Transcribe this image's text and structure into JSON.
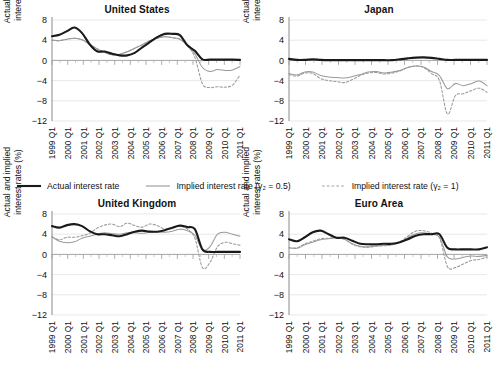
{
  "figure": {
    "ylabel": "Actual and implied\ninterest rates (%)",
    "y_ticks": [
      "8",
      "4",
      "0",
      "−4",
      "−8",
      "−12"
    ],
    "x_ticks": [
      "1999 Q1",
      "2000 Q1",
      "2001 Q1",
      "2002 Q1",
      "2003 Q1",
      "2004 Q1",
      "2005 Q1",
      "2006 Q1",
      "2007 Q1",
      "2008 Q1",
      "2009 Q1",
      "2010 Q1",
      "2011 Q1"
    ]
  },
  "legend": {
    "items": [
      {
        "label": "Actual interest rate",
        "style": "solid-black",
        "color": "#1a1a1a"
      },
      {
        "label": "Implied interest rate (γ₂ = 0.5)",
        "style": "solid-gray",
        "color": "#9a9a9a"
      },
      {
        "label": "Implied interest rate (γ₂ = 1)",
        "style": "dashed-gray",
        "color": "#9a9a9a"
      }
    ]
  },
  "panels": [
    {
      "id": "us",
      "title": "United States"
    },
    {
      "id": "jp",
      "title": "Japan"
    },
    {
      "id": "uk",
      "title": "United Kingdom"
    },
    {
      "id": "ea",
      "title": "Euro Area"
    }
  ],
  "chart_data": [
    {
      "type": "line",
      "title": "United States",
      "xlabel": "",
      "ylabel": "Actual and implied interest rates (%)",
      "ylim": [
        -12,
        8
      ],
      "yticks": [
        8,
        4,
        0,
        -4,
        -8,
        -12
      ],
      "grid": true,
      "legend_position": "below-figure",
      "x": [
        "1999 Q1",
        "1999 Q3",
        "2000 Q1",
        "2000 Q3",
        "2001 Q1",
        "2001 Q3",
        "2002 Q1",
        "2002 Q3",
        "2003 Q1",
        "2003 Q3",
        "2004 Q1",
        "2004 Q3",
        "2005 Q1",
        "2005 Q3",
        "2006 Q1",
        "2006 Q3",
        "2007 Q1",
        "2007 Q3",
        "2008 Q1",
        "2008 Q3",
        "2009 Q1",
        "2009 Q3",
        "2010 Q1",
        "2010 Q3",
        "2011 Q1",
        "2011 Q3"
      ],
      "series": [
        {
          "name": "Actual interest rate",
          "style": "solid-black",
          "color": "#1a1a1a",
          "values": [
            4.8,
            5.1,
            5.8,
            6.5,
            5.4,
            3.2,
            1.8,
            1.75,
            1.3,
            1.0,
            1.0,
            1.5,
            2.6,
            3.6,
            4.6,
            5.25,
            5.25,
            5.0,
            3.0,
            1.9,
            0.2,
            0.15,
            0.15,
            0.15,
            0.15,
            0.1
          ]
        },
        {
          "name": "Implied interest rate (γ₂ = 0.5)",
          "style": "solid-gray",
          "color": "#9a9a9a",
          "values": [
            4.0,
            3.9,
            4.2,
            4.4,
            4.1,
            3.2,
            2.3,
            1.6,
            1.1,
            1.2,
            1.7,
            2.4,
            3.1,
            3.9,
            4.4,
            4.7,
            4.5,
            4.2,
            3.0,
            1.3,
            -1.4,
            -2.2,
            -1.8,
            -2.0,
            -1.9,
            -1.2
          ]
        },
        {
          "name": "Implied interest rate (γ₂ = 1)",
          "style": "dashed-gray",
          "color": "#9a9a9a",
          "values": [
            4.0,
            3.9,
            4.2,
            4.4,
            4.1,
            3.2,
            2.3,
            1.6,
            1.1,
            1.2,
            1.7,
            2.4,
            3.1,
            3.9,
            4.4,
            4.7,
            4.5,
            4.2,
            2.9,
            0.6,
            -4.6,
            -5.4,
            -5.2,
            -5.3,
            -4.9,
            -2.9
          ]
        }
      ]
    },
    {
      "type": "line",
      "title": "Japan",
      "xlabel": "",
      "ylabel": "Actual and implied interest rates (%)",
      "ylim": [
        -12,
        8
      ],
      "yticks": [
        8,
        4,
        0,
        -4,
        -8,
        -12
      ],
      "grid": true,
      "legend_position": "below-figure",
      "x": [
        "1999 Q1",
        "1999 Q3",
        "2000 Q1",
        "2000 Q3",
        "2001 Q1",
        "2001 Q3",
        "2002 Q1",
        "2002 Q3",
        "2003 Q1",
        "2003 Q3",
        "2004 Q1",
        "2004 Q3",
        "2005 Q1",
        "2005 Q3",
        "2006 Q1",
        "2006 Q3",
        "2007 Q1",
        "2007 Q3",
        "2008 Q1",
        "2008 Q3",
        "2009 Q1",
        "2009 Q3",
        "2010 Q1",
        "2010 Q3",
        "2011 Q1",
        "2011 Q3"
      ],
      "series": [
        {
          "name": "Actual interest rate",
          "style": "solid-black",
          "color": "#1a1a1a",
          "values": [
            0.3,
            0.1,
            0.1,
            0.2,
            0.1,
            0.05,
            0.05,
            0.05,
            0.05,
            0.05,
            0.05,
            0.05,
            0.05,
            0.05,
            0.2,
            0.4,
            0.55,
            0.6,
            0.5,
            0.3,
            0.1,
            0.1,
            0.1,
            0.1,
            0.1,
            0.1
          ]
        },
        {
          "name": "Implied interest rate (γ₂ = 0.5)",
          "style": "solid-gray",
          "color": "#9a9a9a",
          "values": [
            -2.6,
            -2.9,
            -2.3,
            -2.3,
            -3.0,
            -3.3,
            -3.4,
            -3.5,
            -3.2,
            -2.8,
            -2.3,
            -2.2,
            -2.5,
            -2.3,
            -2.0,
            -1.4,
            -1.1,
            -1.3,
            -2.2,
            -3.0,
            -5.6,
            -4.6,
            -5.0,
            -4.6,
            -4.1,
            -5.0
          ]
        },
        {
          "name": "Implied interest rate (γ₂ = 1)",
          "style": "dashed-gray",
          "color": "#9a9a9a",
          "values": [
            -2.8,
            -3.1,
            -2.5,
            -2.6,
            -3.6,
            -4.0,
            -4.2,
            -4.4,
            -3.8,
            -3.0,
            -2.5,
            -2.4,
            -2.7,
            -2.5,
            -2.1,
            -1.4,
            -1.1,
            -1.4,
            -2.6,
            -4.0,
            -10.6,
            -7.0,
            -6.6,
            -6.0,
            -5.5,
            -6.3
          ]
        }
      ]
    },
    {
      "type": "line",
      "title": "United Kingdom",
      "xlabel": "",
      "ylabel": "Actual and implied interest rates (%)",
      "ylim": [
        -12,
        8
      ],
      "yticks": [
        8,
        4,
        0,
        -4,
        -8,
        -12
      ],
      "grid": true,
      "legend_position": "above-panel",
      "x": [
        "1999 Q1",
        "1999 Q3",
        "2000 Q1",
        "2000 Q3",
        "2001 Q1",
        "2001 Q3",
        "2002 Q1",
        "2002 Q3",
        "2003 Q1",
        "2003 Q3",
        "2004 Q1",
        "2004 Q3",
        "2005 Q1",
        "2005 Q3",
        "2006 Q1",
        "2006 Q3",
        "2007 Q1",
        "2007 Q3",
        "2008 Q1",
        "2008 Q3",
        "2009 Q1",
        "2009 Q3",
        "2010 Q1",
        "2010 Q3",
        "2011 Q1",
        "2011 Q3"
      ],
      "series": [
        {
          "name": "Actual interest rate",
          "style": "solid-black",
          "color": "#1a1a1a",
          "values": [
            5.6,
            5.3,
            5.8,
            6.0,
            5.6,
            4.6,
            4.0,
            4.0,
            3.8,
            3.6,
            4.0,
            4.5,
            4.7,
            4.5,
            4.5,
            4.8,
            5.3,
            5.7,
            5.4,
            5.0,
            1.0,
            0.5,
            0.5,
            0.5,
            0.5,
            0.5
          ]
        },
        {
          "name": "Implied interest rate (γ₂ = 0.5)",
          "style": "solid-gray",
          "color": "#9a9a9a",
          "values": [
            3.5,
            2.6,
            2.3,
            2.5,
            3.2,
            3.6,
            4.0,
            4.3,
            4.1,
            4.0,
            4.3,
            4.3,
            4.2,
            4.4,
            4.5,
            4.4,
            4.6,
            5.0,
            4.7,
            3.8,
            0.9,
            1.5,
            4.0,
            4.4,
            4.0,
            3.6
          ]
        },
        {
          "name": "Implied interest rate (γ₂ = 1)",
          "style": "dashed-gray",
          "color": "#9a9a9a",
          "values": [
            3.5,
            2.9,
            3.4,
            3.4,
            3.7,
            4.2,
            5.2,
            5.8,
            6.0,
            5.5,
            6.2,
            5.7,
            5.4,
            6.0,
            5.7,
            5.0,
            5.2,
            5.6,
            5.0,
            3.2,
            -2.6,
            -1.6,
            1.5,
            2.4,
            2.1,
            1.8
          ]
        }
      ]
    },
    {
      "type": "line",
      "title": "Euro Area",
      "xlabel": "",
      "ylabel": "Actual and implied interest rates (%)",
      "ylim": [
        -12,
        8
      ],
      "yticks": [
        8,
        4,
        0,
        -4,
        -8,
        -12
      ],
      "grid": true,
      "legend_position": "above-panel",
      "x": [
        "1999 Q1",
        "1999 Q3",
        "2000 Q1",
        "2000 Q3",
        "2001 Q1",
        "2001 Q3",
        "2002 Q1",
        "2002 Q3",
        "2003 Q1",
        "2003 Q3",
        "2004 Q1",
        "2004 Q3",
        "2005 Q1",
        "2005 Q3",
        "2006 Q1",
        "2006 Q3",
        "2007 Q1",
        "2007 Q3",
        "2008 Q1",
        "2008 Q3",
        "2009 Q1",
        "2009 Q3",
        "2010 Q1",
        "2010 Q3",
        "2011 Q1",
        "2011 Q3"
      ],
      "series": [
        {
          "name": "Actual interest rate",
          "style": "solid-black",
          "color": "#1a1a1a",
          "values": [
            3.0,
            2.6,
            3.4,
            4.4,
            4.7,
            4.0,
            3.3,
            3.3,
            2.7,
            2.1,
            2.0,
            2.0,
            2.1,
            2.1,
            2.4,
            3.0,
            3.7,
            4.0,
            4.0,
            4.0,
            1.3,
            1.0,
            1.0,
            1.0,
            1.0,
            1.4
          ]
        },
        {
          "name": "Implied interest rate (γ₂ = 0.5)",
          "style": "solid-gray",
          "color": "#9a9a9a",
          "values": [
            1.3,
            1.2,
            1.9,
            2.4,
            2.9,
            3.1,
            3.3,
            3.0,
            2.1,
            1.6,
            1.5,
            1.7,
            1.8,
            1.9,
            2.4,
            3.3,
            4.1,
            4.3,
            4.0,
            3.4,
            -0.5,
            -0.9,
            -0.6,
            -0.3,
            -0.4,
            -0.2
          ]
        },
        {
          "name": "Implied interest rate (γ₂ = 1)",
          "style": "dashed-gray",
          "color": "#9a9a9a",
          "values": [
            1.3,
            1.3,
            2.1,
            2.6,
            3.1,
            3.2,
            3.3,
            3.0,
            2.0,
            1.5,
            1.4,
            1.6,
            1.7,
            1.9,
            2.5,
            3.6,
            4.6,
            4.7,
            4.2,
            3.3,
            -2.4,
            -2.6,
            -1.9,
            -1.2,
            -1.0,
            -0.5
          ]
        }
      ]
    }
  ]
}
